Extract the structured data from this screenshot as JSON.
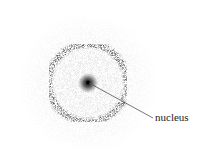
{
  "diagram": {
    "labels": {
      "nucleus": "nucleus"
    },
    "colors": {
      "background": "#ffffff",
      "dots": "#333333",
      "ring": "#3a3a3a",
      "nucleus": "#111111",
      "leader_line": "#555555"
    },
    "geometry": {
      "center": [
        88,
        83
      ],
      "ring_radius": 39,
      "ring_width": 4,
      "cloud_radius": 70,
      "leader_end": [
        153,
        118
      ],
      "label_pos": [
        155,
        114
      ]
    }
  }
}
